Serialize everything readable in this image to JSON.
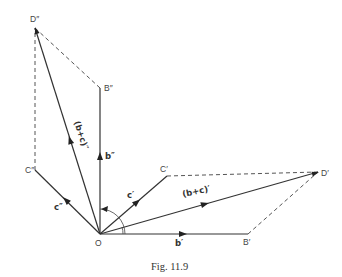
{
  "figure": {
    "caption": "Fig. 11.9",
    "points": {
      "O": {
        "label": "O",
        "x": 100,
        "y": 234
      },
      "B1": {
        "label": "B′",
        "x": 248,
        "y": 234
      },
      "C1": {
        "label": "C′",
        "x": 167,
        "y": 176
      },
      "D1": {
        "label": "D′",
        "x": 318,
        "y": 172
      },
      "B2": {
        "label": "B″",
        "x": 100,
        "y": 88
      },
      "C2": {
        "label": "C″",
        "x": 35,
        "y": 170
      },
      "D2": {
        "label": "D″",
        "x": 35,
        "y": 28
      }
    },
    "vectors": {
      "b1": {
        "label": "b′"
      },
      "c1": {
        "label": "c′"
      },
      "bc1": {
        "label": "(b+c)′"
      },
      "b2": {
        "label": "b″"
      },
      "c2": {
        "label": "c″"
      },
      "bc2": {
        "label": "(b+c)″"
      }
    },
    "solid_segments": [
      "O-B1",
      "O-C1",
      "O-D1",
      "O-B2",
      "O-C2",
      "O-D2"
    ],
    "dashed_segments": [
      "C1-D1",
      "B1-D1",
      "B2-D2",
      "C2-D2"
    ],
    "annotations": [
      "rotation-arc from b′ direction to b″ direction (90°)"
    ]
  }
}
